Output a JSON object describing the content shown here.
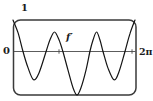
{
  "figure": {
    "y_max_label": "1",
    "origin_label": "0",
    "x_max_label": "2π",
    "curve_label": "f′"
  },
  "colors": {
    "background": "#ffffff",
    "frame": "#3a3a3a",
    "axis": "#4a4a4a",
    "curve": "#141414",
    "text": "#1c1c1c"
  },
  "chart_data": {
    "type": "line",
    "title": "",
    "xlabel": "",
    "ylabel": "",
    "x_range": [
      0,
      6.2832
    ],
    "y_range": [
      -1.45,
      1
    ],
    "x_axis_position": 0,
    "x_tick_positions": [
      2.35,
      6.08
    ],
    "x_max_tick_label": "2π",
    "y_max_tick_label": "1",
    "origin_tick_label": "0",
    "series_name": "f′",
    "points": [
      [
        0.0,
        1.0
      ],
      [
        0.26,
        0.59
      ],
      [
        0.51,
        0.0
      ],
      [
        0.77,
        -0.52
      ],
      [
        1.05,
        -0.9
      ],
      [
        1.33,
        -0.68
      ],
      [
        1.69,
        0.0
      ],
      [
        1.89,
        0.37
      ],
      [
        2.12,
        0.62
      ],
      [
        2.35,
        0.37
      ],
      [
        2.55,
        0.0
      ],
      [
        2.81,
        -0.59
      ],
      [
        3.07,
        -1.16
      ],
      [
        3.27,
        -1.38
      ],
      [
        3.47,
        -1.16
      ],
      [
        3.73,
        -0.59
      ],
      [
        3.93,
        0.0
      ],
      [
        4.09,
        0.37
      ],
      [
        4.27,
        0.62
      ],
      [
        4.44,
        0.37
      ],
      [
        4.6,
        0.0
      ],
      [
        4.85,
        -0.52
      ],
      [
        5.16,
        -0.9
      ],
      [
        5.41,
        -0.65
      ],
      [
        5.72,
        0.0
      ],
      [
        5.97,
        0.56
      ],
      [
        6.23,
        1.0
      ]
    ]
  }
}
